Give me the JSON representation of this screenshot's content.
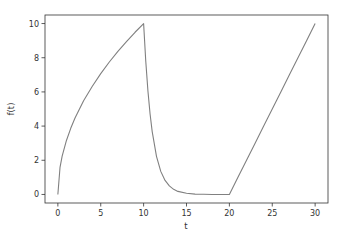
{
  "chart_data": {
    "type": "line",
    "title": "",
    "xlabel": "t",
    "ylabel": "f(t)",
    "xlim": [
      -1.5,
      31.5
    ],
    "ylim": [
      -0.5,
      10.5
    ],
    "x_ticks": [
      0,
      5,
      10,
      15,
      20,
      25,
      30
    ],
    "y_ticks": [
      0,
      2,
      4,
      6,
      8,
      10
    ],
    "grid": false,
    "legend": null,
    "line_color": "#808080",
    "series": [
      {
        "name": "f(t)",
        "description": "0-10: 10*sqrt(t/10); 10-20: exponential decay from 10 to ~0; 20-30: linear from 0 to 10",
        "x": [
          0,
          0.25,
          0.5,
          1,
          1.5,
          2,
          3,
          4,
          5,
          6,
          7,
          8,
          9,
          10,
          10.01,
          10.25,
          10.5,
          10.75,
          11,
          11.5,
          12,
          12.5,
          13,
          13.5,
          14,
          15,
          16,
          17,
          18,
          19,
          20,
          21,
          22,
          23,
          24,
          25,
          26,
          27,
          28,
          29,
          30
        ],
        "values": [
          0,
          1.58,
          2.24,
          3.16,
          3.87,
          4.47,
          5.48,
          6.32,
          7.07,
          7.75,
          8.37,
          8.94,
          9.49,
          10,
          9.9,
          7.79,
          6.07,
          4.72,
          3.68,
          2.23,
          1.35,
          0.82,
          0.5,
          0.3,
          0.18,
          0.07,
          0.02,
          0.01,
          0.0,
          0.0,
          0.0,
          1,
          2,
          3,
          4,
          5,
          6,
          7,
          8,
          9,
          10
        ]
      }
    ]
  }
}
